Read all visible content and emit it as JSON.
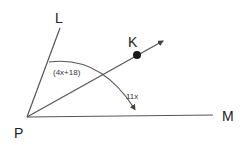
{
  "diagram": {
    "points": {
      "P": {
        "label": "P",
        "x": 27,
        "y": 117
      },
      "L": {
        "label": "L",
        "x": 60,
        "y": 28
      },
      "K": {
        "label": "K",
        "x": 137,
        "y": 55
      },
      "M": {
        "label": "M",
        "x": 213,
        "y": 115
      }
    },
    "rays": [
      {
        "from": "P",
        "through": "L"
      },
      {
        "from": "P",
        "through": "K"
      },
      {
        "from": "P",
        "through": "M"
      }
    ],
    "angles": {
      "LPK": {
        "label": "(4x+18)"
      },
      "LPM": {
        "label": "11x"
      }
    },
    "colors": {
      "line": "#555555",
      "point": "#1a1a1a",
      "text": "#222222"
    }
  }
}
